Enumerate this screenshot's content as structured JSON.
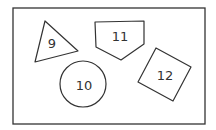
{
  "diagram": {
    "frame": {
      "x": 13,
      "y": 8,
      "width": 192,
      "height": 116
    },
    "shapes": [
      {
        "id": "9",
        "label": "9",
        "type": "triangle",
        "points": "45,21 35,62 78,51",
        "label_pos": [
          52,
          43
        ]
      },
      {
        "id": "10",
        "label": "10",
        "type": "circle",
        "cx": 83,
        "cy": 84,
        "r": 23,
        "label_pos": [
          84,
          85
        ]
      },
      {
        "id": "11",
        "label": "11",
        "type": "pentagon",
        "points": "95,22 144,21 144,44 121,60 96,47",
        "label_pos": [
          120,
          36
        ]
      },
      {
        "id": "12",
        "label": "12",
        "type": "square",
        "points": "156,48 191,67 173,101 138,82",
        "label_pos": [
          165,
          75
        ]
      }
    ],
    "stroke_color": "#333333",
    "background": "#ffffff"
  }
}
